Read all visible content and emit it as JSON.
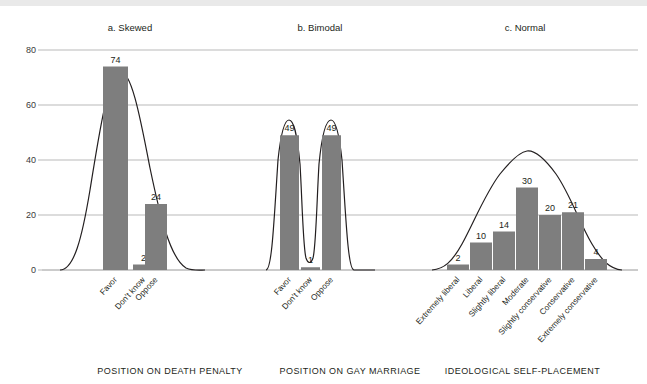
{
  "figure": {
    "ylabel": "Percentage of respondents",
    "yticks": [
      0,
      20,
      40,
      60,
      80
    ],
    "ylim": [
      0,
      80
    ]
  },
  "panels": [
    {
      "title": "a. Skewed",
      "caption": "POSITION ON DEATH PENALTY",
      "categories": [
        "Favor",
        "Don't know",
        "Oppose"
      ],
      "values": [
        74,
        2,
        24
      ]
    },
    {
      "title": "b. Bimodal",
      "caption": "POSITION ON GAY MARRIAGE",
      "categories": [
        "Favor",
        "Don't know",
        "Oppose"
      ],
      "values": [
        49,
        1,
        49
      ]
    },
    {
      "title": "c. Normal",
      "caption": "IDEOLOGICAL SELF-PLACEMENT",
      "categories": [
        "Extremely liberal",
        "Liberal",
        "Slightly liberal",
        "Moderate",
        "Slightly conservative",
        "Conservative",
        "Extremely conservative"
      ],
      "values": [
        2,
        10,
        14,
        30,
        20,
        21,
        4
      ]
    }
  ],
  "chart_data": {
    "type": "bar",
    "title": "",
    "xlabel": "",
    "ylabel": "Percentage of respondents",
    "ylim": [
      0,
      80
    ],
    "yticks": [
      0,
      20,
      40,
      60,
      80
    ],
    "grid": true,
    "legend": "none",
    "panels": [
      {
        "label": "a. Skewed",
        "axis_caption": "POSITION ON DEATH PENALTY",
        "categories": [
          "Favor",
          "Don't know",
          "Oppose"
        ],
        "values": [
          74,
          2,
          24
        ],
        "overlay": "skewed normal curve"
      },
      {
        "label": "b. Bimodal",
        "axis_caption": "POSITION ON GAY MARRIAGE",
        "categories": [
          "Favor",
          "Don't know",
          "Oppose"
        ],
        "values": [
          49,
          1,
          49
        ],
        "overlay": "bimodal curve"
      },
      {
        "label": "c. Normal",
        "axis_caption": "IDEOLOGICAL SELF-PLACEMENT",
        "categories": [
          "Extremely liberal",
          "Liberal",
          "Slightly liberal",
          "Moderate",
          "Slightly conservative",
          "Conservative",
          "Extremely conservative"
        ],
        "values": [
          2,
          10,
          14,
          30,
          20,
          21,
          4
        ],
        "overlay": "normal curve"
      }
    ]
  },
  "colors": {
    "bar": "#7e7e7e",
    "curve": "#231f20",
    "grid": "#a7a7a7",
    "topband": "#e9e9e9"
  }
}
